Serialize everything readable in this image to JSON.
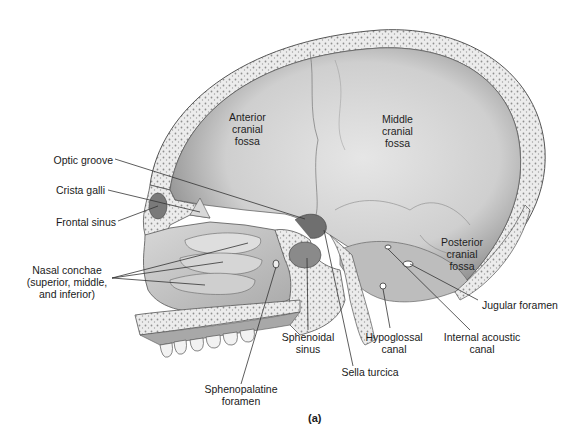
{
  "figure": {
    "caption": "(a)",
    "colors": {
      "bone_fill": "#c9c9c9",
      "bone_dark": "#8a8a8a",
      "cut_bone": "#e9e9e9",
      "cut_dots": "#8f8f8f",
      "outline": "#555555",
      "leader": "#333333",
      "text": "#1a1a1a"
    }
  },
  "labels": {
    "anterior_cranial_fossa": "Anterior\ncranial\nfossa",
    "middle_cranial_fossa": "Middle\ncranial\nfossa",
    "posterior_cranial_fossa": "Posterior\ncranial\nfossa",
    "optic_groove": "Optic groove",
    "crista_galli": "Crista galli",
    "frontal_sinus": "Frontal sinus",
    "nasal_conchae": "Nasal conchae\n(superior, middle,\nand inferior)",
    "sphenopalatine_foramen": "Sphenopalatine\nforamen",
    "sphenoidal_sinus": "Sphenoidal\nsinus",
    "sella_turcica": "Sella turcica",
    "hypoglossal_canal": "Hypoglossal\ncanal",
    "internal_acoustic_canal": "Internal acoustic\ncanal",
    "jugular_foramen": "Jugular foramen"
  }
}
